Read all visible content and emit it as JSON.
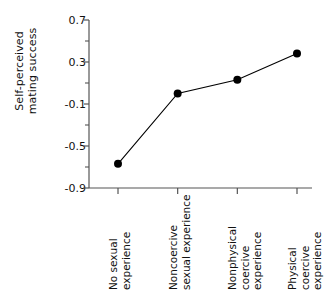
{
  "chart_data": {
    "type": "line",
    "title": "",
    "xlabel": "",
    "ylabel": "Self-perceived\nmating success",
    "categories": [
      "No sexual\nexperience",
      "Noncoercive\nsexual experience",
      "Nonphysical\ncoercive experience",
      "Physical\ncoercive experience"
    ],
    "values": [
      -0.67,
      0.0,
      0.13,
      0.38
    ],
    "ylim": [
      -0.9,
      0.7
    ],
    "ytick_labels": [
      "0.7",
      "0.3",
      "-0.1",
      "-0.5",
      "-0.9"
    ],
    "ytick_values": [
      0.7,
      0.3,
      -0.1,
      -0.5,
      -0.9
    ],
    "yminor_values": [
      0.5,
      0.1,
      -0.3,
      -0.7
    ],
    "grid": false,
    "legend": false,
    "marker": "filled-circle",
    "line_color": "#000000",
    "marker_color": "#000000",
    "axis_color": "#555555"
  }
}
